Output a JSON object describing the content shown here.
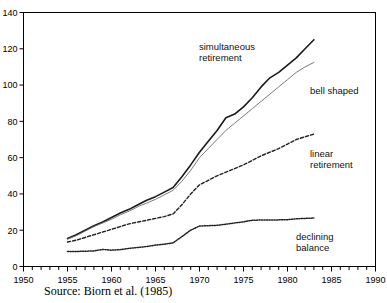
{
  "figure": {
    "source_note": "Source: Biorn et al. (1985)"
  },
  "chart_data": {
    "type": "line",
    "title": "",
    "xlabel": "",
    "ylabel": "",
    "xlim": [
      1950,
      1990
    ],
    "ylim": [
      0,
      140
    ],
    "xticks": [
      1950,
      1955,
      1960,
      1965,
      1970,
      1975,
      1980,
      1985,
      1990
    ],
    "xtick_labels": [
      "1950",
      "1955",
      "1960",
      "1965",
      "1970",
      "1975",
      "1980",
      "1985",
      "1990"
    ],
    "x_minor_tick_step": 1,
    "yticks": [
      0,
      20,
      40,
      60,
      80,
      100,
      120,
      140
    ],
    "ytick_labels": [
      "0",
      "20",
      "40",
      "60",
      "80",
      "100",
      "120",
      "140"
    ],
    "grid": false,
    "legend_position": "inline-annotations",
    "x": [
      1955,
      1956,
      1957,
      1958,
      1959,
      1960,
      1961,
      1962,
      1963,
      1964,
      1965,
      1966,
      1967,
      1968,
      1969,
      1970,
      1971,
      1972,
      1973,
      1974,
      1975,
      1976,
      1977,
      1978,
      1979,
      1980,
      1981,
      1982,
      1983
    ],
    "series": [
      {
        "name": "simultaneous retirement",
        "style": "solid-thick",
        "color": "#1a1a1a",
        "values": [
          15.5,
          17.5,
          20.0,
          22.5,
          24.5,
          27.0,
          29.5,
          31.5,
          34.0,
          36.5,
          38.5,
          41.0,
          43.5,
          49.5,
          56.0,
          63.0,
          69.0,
          75.0,
          82.0,
          84.0,
          88.0,
          93.0,
          99.0,
          104.0,
          107.0,
          111.0,
          115.0,
          120.0,
          125.0
        ]
      },
      {
        "name": "bell shaped",
        "style": "solid-thin",
        "color": "#6b6b6b",
        "values": [
          15.0,
          17.0,
          19.5,
          22.0,
          24.0,
          26.0,
          28.5,
          30.5,
          33.0,
          35.0,
          37.0,
          39.5,
          42.0,
          47.0,
          53.0,
          60.0,
          65.0,
          70.0,
          75.0,
          79.0,
          83.0,
          87.0,
          91.0,
          95.0,
          99.0,
          103.0,
          107.0,
          110.0,
          112.5
        ]
      },
      {
        "name": "linear retirement",
        "style": "dashed",
        "color": "#222222",
        "values": [
          13.5,
          14.5,
          16.0,
          17.5,
          19.0,
          20.5,
          22.0,
          23.5,
          24.5,
          25.5,
          26.5,
          27.5,
          29.0,
          34.0,
          40.0,
          45.0,
          47.5,
          50.0,
          52.0,
          54.0,
          56.0,
          58.5,
          61.0,
          63.0,
          65.0,
          67.5,
          70.0,
          71.5,
          73.0
        ]
      },
      {
        "name": "declining balance",
        "style": "dotted",
        "color": "#222222",
        "values": [
          8.3,
          8.3,
          8.4,
          8.6,
          9.4,
          9.0,
          9.3,
          10.0,
          10.5,
          11.0,
          11.8,
          12.3,
          13.0,
          16.5,
          20.0,
          22.3,
          22.5,
          22.7,
          23.3,
          24.0,
          24.6,
          25.5,
          25.6,
          25.6,
          25.7,
          25.8,
          26.3,
          26.5,
          26.7
        ]
      }
    ],
    "annotations": [
      {
        "text": "simultaneous\nretirement",
        "line1": "simultaneous",
        "line2": "retirement"
      },
      {
        "text": "bell shaped",
        "line1": "bell shaped",
        "line2": ""
      },
      {
        "text": "linear\nretirement",
        "line1": "linear",
        "line2": "retirement"
      },
      {
        "text": "declining\nbalance",
        "line1": "declining",
        "line2": "balance"
      }
    ]
  }
}
